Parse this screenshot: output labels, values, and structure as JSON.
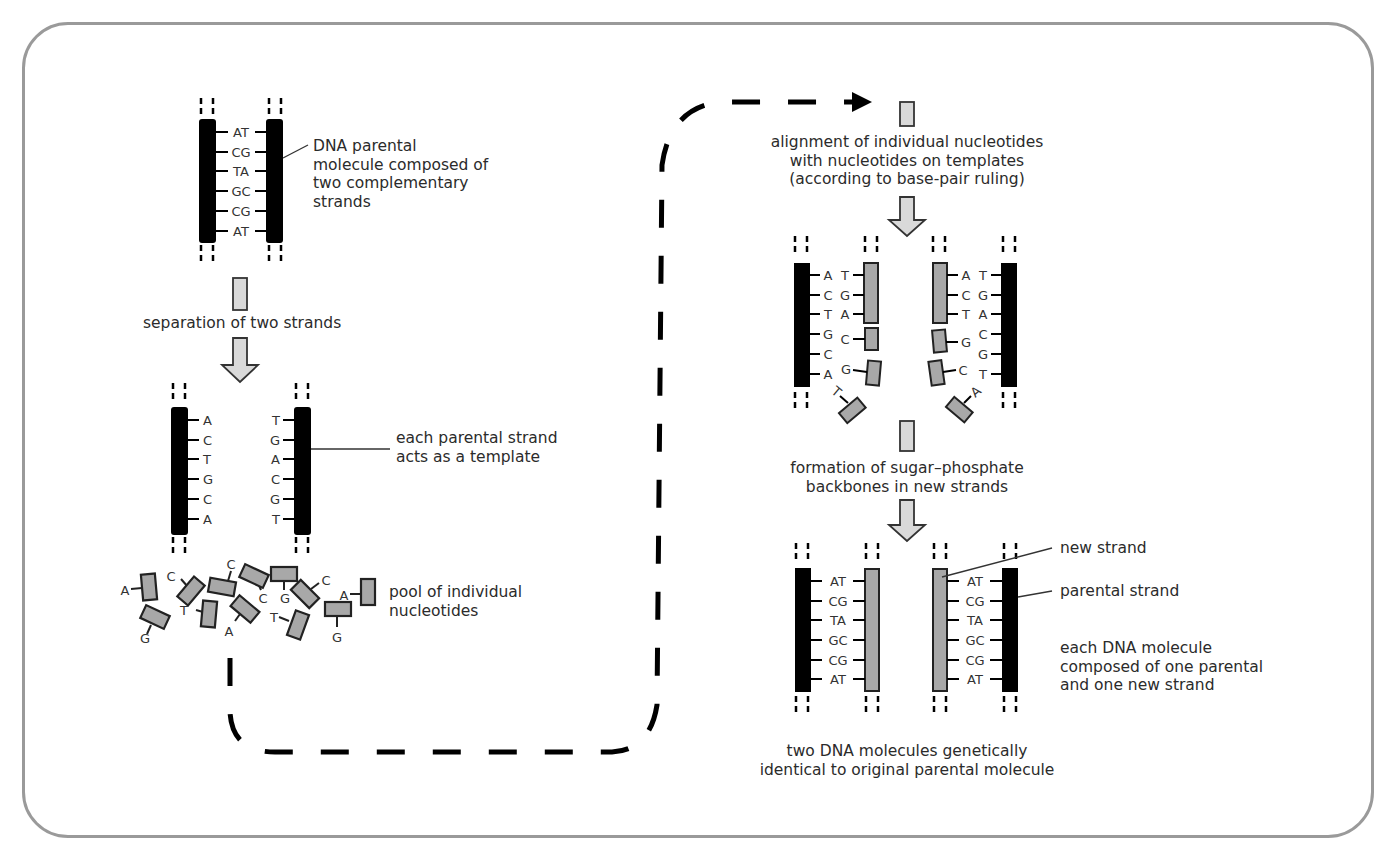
{
  "diagram": {
    "frame_color": "#9a9a9a",
    "colors": {
      "parental_strand": "#000000",
      "new_strand": "#a8a8a8",
      "arrow_fill": "#d9d9d9",
      "text": "#2b2b2b"
    },
    "labels": {
      "parental_molecule": "DNA parental\nmolecule composed of\ntwo complementary\nstrands",
      "separation": "separation of two strands",
      "template": "each parental strand\nacts as a template",
      "pool": "pool of individual\nnucleotides",
      "alignment": "alignment of individual nucleotides\nwith nucleotides on templates\n(according to base-pair ruling)",
      "formation": "formation of sugar–phosphate\nbackbones in new strands",
      "new_strand": "new strand",
      "parental_strand": "parental strand",
      "each_molecule": "each DNA molecule\ncomposed of one parental\nand one new strand",
      "result": "two DNA molecules genetically\nidentical to original parental molecule"
    },
    "parental_pairs": [
      "AT",
      "CG",
      "TA",
      "GC",
      "CG",
      "AT"
    ],
    "left_template": [
      "A",
      "C",
      "T",
      "G",
      "C",
      "A"
    ],
    "right_template": [
      "T",
      "G",
      "A",
      "C",
      "G",
      "T"
    ],
    "pool_nucleotides": [
      "A",
      "C",
      "T",
      "C",
      "G",
      "C",
      "A",
      "G",
      "T",
      "A",
      "T",
      "G"
    ],
    "alignment_left": {
      "template": [
        "A",
        "C",
        "T",
        "G",
        "C",
        "A"
      ],
      "paired": [
        "T",
        "G",
        "A",
        "C",
        "G",
        "T"
      ]
    },
    "alignment_right": {
      "template": [
        "T",
        "G",
        "A",
        "C",
        "G",
        "T"
      ],
      "paired": [
        "A",
        "C",
        "T",
        "G",
        "C",
        "A"
      ]
    },
    "final_left_pairs": [
      "AT",
      "CG",
      "TA",
      "GC",
      "CG",
      "AT"
    ],
    "final_right_pairs": [
      "AT",
      "CG",
      "TA",
      "GC",
      "CG",
      "AT"
    ]
  }
}
